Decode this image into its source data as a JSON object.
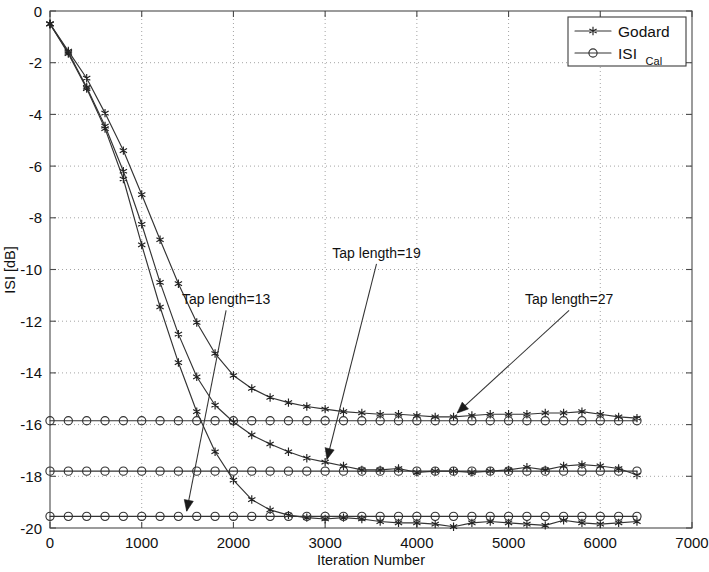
{
  "chart_data": {
    "type": "line",
    "title": "",
    "xlabel": "Iteration Number",
    "ylabel": "ISI [dB]",
    "xlim": [
      0,
      7000
    ],
    "ylim": [
      -20,
      0
    ],
    "xticks": [
      0,
      1000,
      2000,
      3000,
      4000,
      5000,
      6000,
      7000
    ],
    "yticks": [
      0,
      -2,
      -4,
      -6,
      -8,
      -10,
      -12,
      -14,
      -16,
      -18,
      -20
    ],
    "xtick_labels": [
      "0",
      "1000",
      "2000",
      "3000",
      "4000",
      "5000",
      "6000",
      "7000"
    ],
    "ytick_labels": [
      "0",
      "-2",
      "-4",
      "-6",
      "-8",
      "-10",
      "-12",
      "-14",
      "-16",
      "-18",
      "-20"
    ],
    "grid": true,
    "grid_style": "dotted",
    "legend": {
      "position": "top-right",
      "entries": [
        {
          "label": "Godard",
          "marker": "star",
          "sub": ""
        },
        {
          "label": "ISI",
          "marker": "circle",
          "sub": "Cal"
        }
      ]
    },
    "annotations": [
      {
        "text": "Tap length=13",
        "text_x": 1920,
        "text_y": -11.35,
        "tip_x": 1490,
        "tip_y": -19.35
      },
      {
        "text": "Tap length=19",
        "text_x": 3560,
        "text_y": -9.55,
        "tip_x": 3020,
        "tip_y": -17.35
      },
      {
        "text": "Tap length=27",
        "text_x": 5660,
        "text_y": -11.35,
        "tip_x": 4440,
        "tip_y": -15.55
      }
    ],
    "marker_step": 200,
    "series": [
      {
        "name": "Godard, Tap length=13",
        "marker": "star",
        "x": [
          0,
          200,
          400,
          600,
          800,
          1000,
          1200,
          1400,
          1600,
          1800,
          2000,
          2200,
          2400,
          2600,
          2800,
          3000,
          3200,
          3400,
          3600,
          3800,
          4000,
          4200,
          4400,
          4600,
          4800,
          5000,
          5200,
          5400,
          5600,
          5800,
          6000,
          6200,
          6400
        ],
        "y": [
          -0.5,
          -1.6,
          -2.95,
          -4.45,
          -6.2,
          -8.25,
          -10.5,
          -12.5,
          -14.15,
          -15.25,
          -15.9,
          -16.4,
          -16.75,
          -17.05,
          -17.3,
          -17.45,
          -17.6,
          -17.75,
          -17.75,
          -17.7,
          -17.85,
          -17.8,
          -17.8,
          -17.85,
          -17.8,
          -17.75,
          -17.65,
          -17.75,
          -17.6,
          -17.55,
          -17.6,
          -17.7,
          -17.95
        ]
      },
      {
        "name": "Godard, Tap length=19",
        "marker": "star",
        "x": [
          0,
          200,
          400,
          600,
          800,
          1000,
          1200,
          1400,
          1600,
          1800,
          2000,
          2200,
          2400,
          2600,
          2800,
          3000,
          3200,
          3400,
          3600,
          3800,
          4000,
          4200,
          4400,
          4600,
          4800,
          5000,
          5200,
          5400,
          5600,
          5800,
          6000,
          6200,
          6400
        ],
        "y": [
          -0.5,
          -1.65,
          -3.0,
          -4.55,
          -6.5,
          -9.05,
          -11.45,
          -13.6,
          -15.5,
          -17.05,
          -18.15,
          -18.9,
          -19.3,
          -19.5,
          -19.6,
          -19.65,
          -19.6,
          -19.65,
          -19.75,
          -19.8,
          -19.8,
          -19.85,
          -19.95,
          -19.8,
          -19.75,
          -19.8,
          -19.85,
          -19.9,
          -19.7,
          -19.8,
          -19.85,
          -19.8,
          -19.75
        ]
      },
      {
        "name": "Godard, Tap length=27",
        "marker": "star",
        "x": [
          0,
          200,
          400,
          600,
          800,
          1000,
          1200,
          1400,
          1600,
          1800,
          2000,
          2200,
          2400,
          2600,
          2800,
          3000,
          3200,
          3400,
          3600,
          3800,
          4000,
          4200,
          4400,
          4600,
          4800,
          5000,
          5200,
          5400,
          5600,
          5800,
          6000,
          6200,
          6400
        ],
        "y": [
          -0.5,
          -1.55,
          -2.6,
          -3.95,
          -5.4,
          -7.1,
          -8.85,
          -10.55,
          -12.05,
          -13.25,
          -14.1,
          -14.6,
          -14.95,
          -15.15,
          -15.3,
          -15.4,
          -15.5,
          -15.55,
          -15.6,
          -15.6,
          -15.65,
          -15.7,
          -15.7,
          -15.65,
          -15.6,
          -15.6,
          -15.6,
          -15.55,
          -15.55,
          -15.5,
          -15.6,
          -15.7,
          -15.75
        ]
      },
      {
        "name": "ISI Cal, Tap length=27",
        "marker": "circle",
        "x": [
          0,
          200,
          400,
          600,
          800,
          1000,
          1200,
          1400,
          1600,
          1800,
          2000,
          2200,
          2400,
          2600,
          2800,
          3000,
          3200,
          3400,
          3600,
          3800,
          4000,
          4200,
          4400,
          4600,
          4800,
          5000,
          5200,
          5400,
          5600,
          5800,
          6000,
          6200,
          6400
        ],
        "y": [
          -15.85,
          -15.85,
          -15.85,
          -15.85,
          -15.85,
          -15.85,
          -15.85,
          -15.85,
          -15.85,
          -15.85,
          -15.85,
          -15.85,
          -15.85,
          -15.85,
          -15.85,
          -15.85,
          -15.85,
          -15.85,
          -15.85,
          -15.85,
          -15.85,
          -15.85,
          -15.85,
          -15.85,
          -15.85,
          -15.85,
          -15.85,
          -15.85,
          -15.85,
          -15.85,
          -15.85,
          -15.85,
          -15.85
        ]
      },
      {
        "name": "ISI Cal, Tap length=19",
        "marker": "circle",
        "x": [
          0,
          200,
          400,
          600,
          800,
          1000,
          1200,
          1400,
          1600,
          1800,
          2000,
          2200,
          2400,
          2600,
          2800,
          3000,
          3200,
          3400,
          3600,
          3800,
          4000,
          4200,
          4400,
          4600,
          4800,
          5000,
          5200,
          5400,
          5600,
          5800,
          6000,
          6200,
          6400
        ],
        "y": [
          -17.8,
          -17.8,
          -17.8,
          -17.8,
          -17.8,
          -17.8,
          -17.8,
          -17.8,
          -17.8,
          -17.8,
          -17.8,
          -17.8,
          -17.8,
          -17.8,
          -17.8,
          -17.8,
          -17.8,
          -17.8,
          -17.8,
          -17.8,
          -17.8,
          -17.8,
          -17.8,
          -17.8,
          -17.8,
          -17.8,
          -17.8,
          -17.8,
          -17.8,
          -17.8,
          -17.8,
          -17.8,
          -17.8
        ]
      },
      {
        "name": "ISI Cal, Tap length=13",
        "marker": "circle",
        "x": [
          0,
          200,
          400,
          600,
          800,
          1000,
          1200,
          1400,
          1600,
          1800,
          2000,
          2200,
          2400,
          2600,
          2800,
          3000,
          3200,
          3400,
          3600,
          3800,
          4000,
          4200,
          4400,
          4600,
          4800,
          5000,
          5200,
          5400,
          5600,
          5800,
          6000,
          6200,
          6400
        ],
        "y": [
          -19.55,
          -19.55,
          -19.55,
          -19.55,
          -19.55,
          -19.55,
          -19.55,
          -19.55,
          -19.55,
          -19.55,
          -19.55,
          -19.55,
          -19.55,
          -19.55,
          -19.55,
          -19.55,
          -19.55,
          -19.55,
          -19.55,
          -19.55,
          -19.55,
          -19.55,
          -19.55,
          -19.55,
          -19.55,
          -19.55,
          -19.55,
          -19.55,
          -19.55,
          -19.55,
          -19.55,
          -19.55,
          -19.55
        ]
      }
    ],
    "colors": {
      "line": "#333333",
      "marker": "#222222",
      "axis": "#4a4a4a",
      "grid": "#9a9a9a",
      "background": "#ffffff"
    }
  }
}
